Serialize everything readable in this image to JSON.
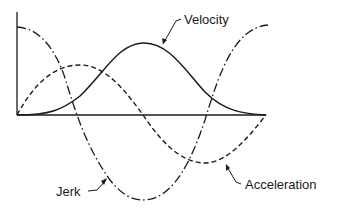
{
  "diagram": {
    "type": "motion-curves",
    "labels": {
      "velocity": "Velocity",
      "acceleration": "Acceleration",
      "jerk": "Jerk"
    },
    "colors": {
      "stroke": "#1a1a1a",
      "background": "#ffffff"
    },
    "curves": [
      {
        "name": "Velocity",
        "style": "solid",
        "shape": "single hump: 0 → peak → 0"
      },
      {
        "name": "Acceleration",
        "style": "dashed",
        "shape": "one period sine: 0 → max → min → 0"
      },
      {
        "name": "Jerk",
        "style": "dash-dot",
        "shape": "cosine: max → min → max"
      }
    ]
  }
}
